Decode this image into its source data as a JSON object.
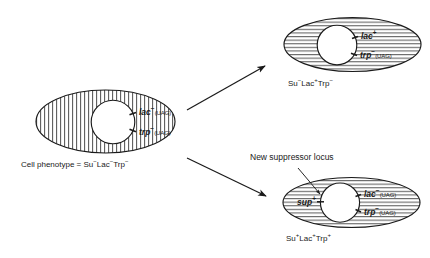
{
  "figure": {
    "type": "biology-genetics-diagram",
    "topic": "Nonsense suppressor mutation restoring Lac and Trp phenotypes",
    "annotation": "New suppressor locus",
    "ink_color": "#1a1a1a",
    "fill_color": "#ffffff"
  },
  "cells": [
    {
      "id": "parent-cell",
      "role": "starting cell",
      "hatch": "vertical",
      "genes": [
        {
          "name": "lac",
          "sign": "−",
          "note": "(UAG)"
        },
        {
          "name": "trp",
          "sign": "−",
          "note": "(UAG)"
        }
      ],
      "caption_prefix": "Cell phenotype = ",
      "phenotype": [
        {
          "name": "Su",
          "sign": "−"
        },
        {
          "name": "Lac",
          "sign": "−"
        },
        {
          "name": "Trp",
          "sign": "−"
        }
      ]
    },
    {
      "id": "revertant-cell",
      "role": "lac revertant daughter cell",
      "hatch": "horizontal",
      "genes": [
        {
          "name": "lac",
          "sign": "+",
          "note": ""
        },
        {
          "name": "trp",
          "sign": "−",
          "note": "(UAG)"
        }
      ],
      "caption_prefix": "",
      "phenotype": [
        {
          "name": "Su",
          "sign": "−"
        },
        {
          "name": "Lac",
          "sign": "+"
        },
        {
          "name": "Trp",
          "sign": "−"
        }
      ]
    },
    {
      "id": "suppressor-cell",
      "role": "suppressor mutant daughter cell",
      "hatch": "horizontal",
      "suppressor_gene": {
        "name": "sup",
        "sign": "+"
      },
      "genes": [
        {
          "name": "lac",
          "sign": "−",
          "note": "(UAG)"
        },
        {
          "name": "trp",
          "sign": "−",
          "note": "(UAG)"
        }
      ],
      "caption_prefix": "",
      "phenotype": [
        {
          "name": "Su",
          "sign": "+"
        },
        {
          "name": "Lac",
          "sign": "+"
        },
        {
          "name": "Trp",
          "sign": "+"
        }
      ]
    }
  ],
  "arrows": [
    {
      "id": "arrow-to-revertant",
      "direction": "up-right"
    },
    {
      "id": "arrow-to-suppressor",
      "direction": "down-right"
    },
    {
      "id": "arrow-annotation-pointer",
      "direction": "down-right-thin"
    }
  ]
}
